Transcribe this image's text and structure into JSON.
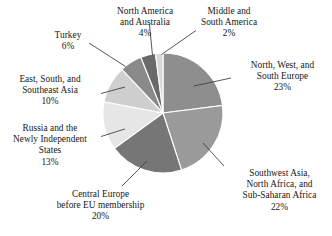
{
  "chart_data": {
    "type": "pie",
    "title": "",
    "subtitle": "",
    "xlabel": "",
    "ylabel": "",
    "legend_position": "none",
    "grid": false,
    "value_unit": "%",
    "start_angle_deg": 0,
    "direction": "clockwise",
    "categories": [
      "North, West, and South Europe",
      "Southwest Asia, North Africa, and Sub-Saharan Africa",
      "Central Europe before EU membership",
      "Russia and the Newly Independent States",
      "East, South, and Southeast Asia",
      "Turkey",
      "North America and Australia",
      "Middle and South America"
    ],
    "values": [
      23,
      22,
      20,
      13,
      10,
      6,
      4,
      2
    ],
    "colors": [
      "#8e8e8e",
      "#9a9a9a",
      "#767676",
      "#e6e6e6",
      "#cfcfcf",
      "#8a8a8a",
      "#6a6a6a",
      "#d8d8d8"
    ],
    "slices": [
      {
        "label": "North, West, and South Europe",
        "value": 23,
        "value_text": "23%",
        "color": "#8e8e8e"
      },
      {
        "label": "Southwest Asia, North Africa, and Sub-Saharan Africa",
        "value": 22,
        "value_text": "22%",
        "color": "#9a9a9a"
      },
      {
        "label": "Central Europe before EU membership",
        "value": 20,
        "value_text": "20%",
        "color": "#767676"
      },
      {
        "label": "Russia and the Newly Independent States",
        "value": 13,
        "value_text": "13%",
        "color": "#e6e6e6"
      },
      {
        "label": "East, South, and Southeast Asia",
        "value": 10,
        "value_text": "10%",
        "color": "#cfcfcf"
      },
      {
        "label": "Turkey",
        "value": 6,
        "value_text": "6%",
        "color": "#8a8a8a"
      },
      {
        "label": "North America and Australia",
        "value": 4,
        "value_text": "4%",
        "color": "#6a6a6a"
      },
      {
        "label": "Middle and South America",
        "value": 2,
        "value_text": "2%",
        "color": "#d8d8d8"
      }
    ]
  },
  "labels": {
    "north_america": {
      "line1": "North America",
      "line2": "and Australia",
      "value": "4%"
    },
    "middle_south_america": {
      "line1": "Middle and",
      "line2": "South America",
      "value": "2%"
    },
    "turkey": {
      "line1": "Turkey",
      "value": "6%"
    },
    "north_west_south_europe": {
      "line1": "North, West, and",
      "line2": "South Europe",
      "value": "23%"
    },
    "east_south_southeast_asia": {
      "line1": "East, South, and",
      "line2": "Southeast Asia",
      "value": "10%"
    },
    "russia_nis": {
      "line1": "Russia and the",
      "line2": "Newly Independent",
      "line3": "States",
      "value": "13%"
    },
    "southwest_asia_africa": {
      "line1": "Southwest Asia,",
      "line2": "North Africa, and",
      "line3": "Sub-Saharan Africa",
      "value": "22%"
    },
    "central_europe": {
      "line1": "Central Europe",
      "line2": "before EU membership",
      "value": "20%"
    }
  },
  "style": {
    "background": "#ffffff",
    "text_color": "#161616",
    "slice_border": "#ffffff",
    "leader_line": "#3a3a3a"
  }
}
